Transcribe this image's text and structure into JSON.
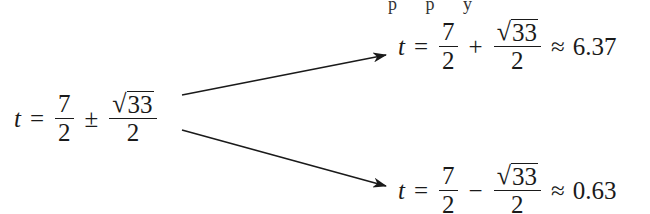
{
  "partial_top_text": "p p y",
  "source_equation": {
    "var": "t",
    "eq": "=",
    "frac1": {
      "num": "7",
      "den": "2"
    },
    "op": "±",
    "frac2": {
      "num_sqrt": "33",
      "den": "2"
    }
  },
  "branch_plus": {
    "var": "t",
    "eq": "=",
    "frac1": {
      "num": "7",
      "den": "2"
    },
    "op": "+",
    "frac2": {
      "num_sqrt": "33",
      "den": "2"
    },
    "approx": "≈",
    "value": "6.37"
  },
  "branch_minus": {
    "var": "t",
    "eq": "=",
    "frac1": {
      "num": "7",
      "den": "2"
    },
    "op": "−",
    "frac2": {
      "num_sqrt": "33",
      "den": "2"
    },
    "approx": "≈",
    "value": "0.63"
  },
  "colors": {
    "ink": "#1a1a1a",
    "background": "#ffffff"
  }
}
